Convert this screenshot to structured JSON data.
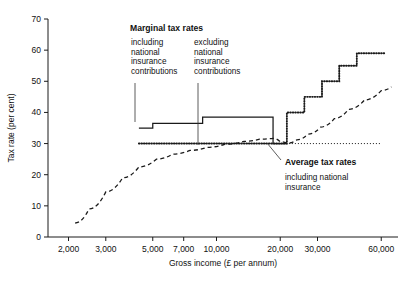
{
  "chart_data": {
    "type": "line",
    "title": "",
    "xlabel": "Gross income (£ per annum)",
    "ylabel": "Tax rate (per cent)",
    "xscale": "log",
    "xlim": [
      1600,
      72000
    ],
    "ylim": [
      0,
      70
    ],
    "grid": false,
    "legend_position": "inline-annotations",
    "xticklabels": [
      "2,000",
      "3,000",
      "5,000",
      "7,000",
      "10,000",
      "20,000",
      "30,000",
      "60,000"
    ],
    "xtickvalues": [
      2000,
      3000,
      5000,
      7000,
      10000,
      20000,
      30000,
      60000
    ],
    "yticklabels": [
      "0",
      "10",
      "20",
      "30",
      "40",
      "50",
      "60",
      "70"
    ],
    "ytickvalues": [
      0,
      10,
      20,
      30,
      40,
      50,
      60,
      70
    ],
    "reference_line": {
      "label": "30 per cent reference",
      "y": 30,
      "style": "dotted",
      "x_from": 4300,
      "x_to": 60000
    },
    "series": [
      {
        "name": "Marginal tax rates including national insurance contributions",
        "style": "solid",
        "type": "step",
        "points": [
          {
            "x": 4300,
            "y": 35.0
          },
          {
            "x": 5000,
            "y": 35.0
          },
          {
            "x": 5000,
            "y": 36.5
          },
          {
            "x": 8600,
            "y": 36.5
          },
          {
            "x": 8600,
            "y": 38.5
          },
          {
            "x": 18500,
            "y": 38.5
          },
          {
            "x": 18500,
            "y": 30.0
          },
          {
            "x": 21500,
            "y": 30.0
          }
        ]
      },
      {
        "name": "Marginal tax rates excluding national insurance contributions",
        "style": "dotted",
        "type": "step",
        "points": [
          {
            "x": 4300,
            "y": 30.0
          },
          {
            "x": 18500,
            "y": 30.0
          },
          {
            "x": 21500,
            "y": 30.0
          },
          {
            "x": 21500,
            "y": 40.0
          },
          {
            "x": 26000,
            "y": 40.0
          },
          {
            "x": 26000,
            "y": 45.0
          },
          {
            "x": 31500,
            "y": 45.0
          },
          {
            "x": 31500,
            "y": 50.0
          },
          {
            "x": 38000,
            "y": 50.0
          },
          {
            "x": 38000,
            "y": 55.0
          },
          {
            "x": 46000,
            "y": 55.0
          },
          {
            "x": 46000,
            "y": 59.0
          },
          {
            "x": 62000,
            "y": 59.0
          }
        ]
      },
      {
        "name": "Average tax rates including national insurance",
        "style": "dashed",
        "type": "curve",
        "points": [
          {
            "x": 2150,
            "y": 4.5
          },
          {
            "x": 2500,
            "y": 9.0
          },
          {
            "x": 3000,
            "y": 14.5
          },
          {
            "x": 3600,
            "y": 19.0
          },
          {
            "x": 4300,
            "y": 22.5
          },
          {
            "x": 5200,
            "y": 25.0
          },
          {
            "x": 6200,
            "y": 26.6
          },
          {
            "x": 7500,
            "y": 27.8
          },
          {
            "x": 9000,
            "y": 28.8
          },
          {
            "x": 11000,
            "y": 29.8
          },
          {
            "x": 13500,
            "y": 30.7
          },
          {
            "x": 16000,
            "y": 31.4
          },
          {
            "x": 18500,
            "y": 31.7
          },
          {
            "x": 20000,
            "y": 30.6
          },
          {
            "x": 21500,
            "y": 30.1
          },
          {
            "x": 24000,
            "y": 31.2
          },
          {
            "x": 27000,
            "y": 33.0
          },
          {
            "x": 31000,
            "y": 35.3
          },
          {
            "x": 36000,
            "y": 38.0
          },
          {
            "x": 42000,
            "y": 41.0
          },
          {
            "x": 50000,
            "y": 44.0
          },
          {
            "x": 60000,
            "y": 47.0
          },
          {
            "x": 67000,
            "y": 48.2
          }
        ]
      }
    ],
    "annotations": [
      {
        "id": "marginal-heading",
        "text": "Marginal tax rates",
        "bold": true,
        "x_px": 130,
        "y_px": 31
      },
      {
        "id": "marginal-including",
        "lines": [
          "including",
          "national",
          "insurance",
          "contributions"
        ],
        "x_px": 131,
        "y_px": 45,
        "leader": {
          "x1": 135,
          "y1": 83,
          "x2": 135,
          "y2": 122
        }
      },
      {
        "id": "marginal-excluding",
        "lines": [
          "excluding",
          "national",
          "insurance",
          "contributions"
        ],
        "x_px": 194,
        "y_px": 45,
        "leader": {
          "x1": 198,
          "y1": 83,
          "x2": 198,
          "y2": 145
        }
      },
      {
        "id": "average-heading",
        "text": "Average tax rates",
        "bold": true,
        "x_px": 285,
        "y_px": 165
      },
      {
        "id": "average-sub",
        "lines": [
          "including national",
          "insurance"
        ],
        "x_px": 285,
        "y_px": 180,
        "leader": {
          "x1": 281,
          "y1": 160,
          "x2": 267,
          "y2": 143
        }
      }
    ]
  },
  "figure": {
    "plot_left_px": 48,
    "plot_right_px": 398,
    "plot_top_px": 19,
    "plot_bottom_px": 237
  }
}
